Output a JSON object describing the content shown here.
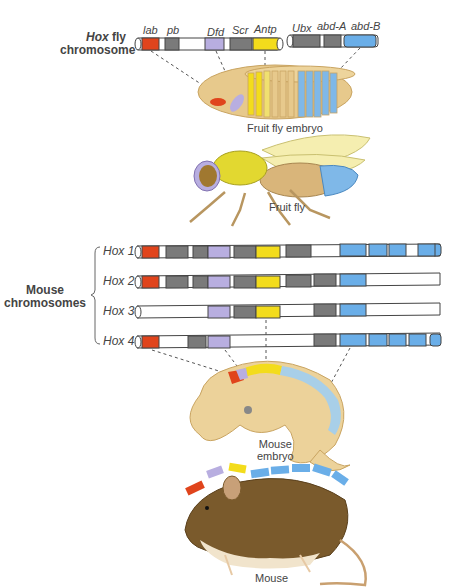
{
  "colors": {
    "lab": "#e0441c",
    "pb": "#7a7a7a",
    "dfd": "#b8aee0",
    "scr": "#7a7a7a",
    "antp": "#f3dc1c",
    "ubx": "#7a7a7a",
    "abdA": "#7a7a7a",
    "abdB": "#6aaee8",
    "gray": "#7a7a7a",
    "white": "#ffffff",
    "outline": "#444444",
    "body": "#e7c98c",
    "mouse_fur": "#7a5a2c"
  },
  "fly": {
    "title_line1": "Hox fly",
    "title_hox": "Hox",
    "title_fly": " fly",
    "title_line2": "chromosome",
    "genes": [
      {
        "name": "lab",
        "color": "red"
      },
      {
        "name": "pb",
        "color": "gray"
      },
      {
        "name": "Dfd",
        "color": "lavender"
      },
      {
        "name": "Scr",
        "color": "gray"
      },
      {
        "name": "Antp",
        "color": "yellow"
      },
      {
        "name": "Ubx",
        "color": "gray"
      },
      {
        "name": "abd-A",
        "color": "gray"
      },
      {
        "name": "abd-B",
        "color": "blue"
      }
    ],
    "embryo_caption": "Fruit fly embryo",
    "adult_caption": "Fruit fly"
  },
  "mouse": {
    "title_line1": "Mouse",
    "title_line2": "chromosomes",
    "clusters": [
      {
        "label": "Hox 1"
      },
      {
        "label": "Hox 2"
      },
      {
        "label": "Hox 3"
      },
      {
        "label": "Hox 4"
      }
    ],
    "embryo_caption_line1": "Mouse",
    "embryo_caption_line2": "embryo",
    "adult_caption": "Mouse"
  }
}
